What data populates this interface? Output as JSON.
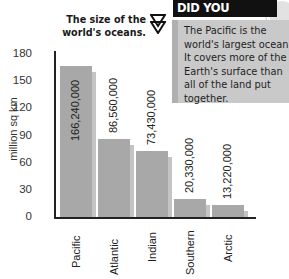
{
  "title": {
    "line1": "The size of the",
    "line2": "world's oceans.",
    "icon": "double-triangle-icon"
  },
  "did_you_know": {
    "heading": "DID YOU KNOW?",
    "text": "The Pacific is the world's largest ocean. It covers more of the Earth's surface than all of the land put together."
  },
  "colors": {
    "bar": "#a8a8a8",
    "bar_shadow": "#c4c4c4",
    "callout_bg": "#c9c9c9",
    "heading_bg": "#111111"
  },
  "chart_data": {
    "type": "bar",
    "title": "The size of the world's oceans.",
    "categories": [
      "Pacific",
      "Atlantic",
      "Indian",
      "Southern",
      "Arctic"
    ],
    "values": [
      166.24,
      86.56,
      73.43,
      20.33,
      13.22
    ],
    "value_labels": [
      "166,240,000",
      "86,560,000",
      "73,430,000",
      "20,330,000",
      "13,220,000"
    ],
    "xlabel": "",
    "ylabel": "million sq km",
    "yticks": [
      0,
      30,
      60,
      90,
      120,
      150,
      180
    ],
    "ylim": [
      0,
      180
    ],
    "grid": false,
    "legend": null
  }
}
